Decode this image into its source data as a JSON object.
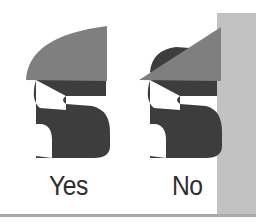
{
  "figure": {
    "panels": [
      {
        "id": "yes",
        "label": "Yes",
        "cap_style": "curved",
        "description": "Cap shape sits flush on top of the S glyph"
      },
      {
        "id": "no",
        "label": "No",
        "cap_style": "wedge",
        "description": "Wedge shape overlaps the S glyph against a wall"
      }
    ],
    "colors": {
      "glyph": "#3d3d3d",
      "cap": "#7f7f7f",
      "wall": "#c2c2c2",
      "baseline": "#a9a9a9",
      "background": "#ffffff",
      "label_text": "#2e2e2e"
    }
  }
}
